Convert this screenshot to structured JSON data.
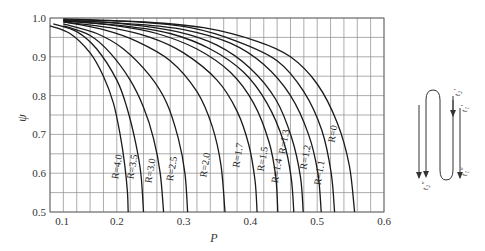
{
  "chart_data": {
    "type": "line",
    "title": "",
    "xlabel": "P",
    "ylabel": "ψ",
    "xlim": [
      0.1,
      0.6
    ],
    "ylim": [
      0.5,
      1.0
    ],
    "grid": true,
    "x_ticks": [
      "0.1",
      "0.2",
      "0.3",
      "0.4",
      "0.5",
      "0.6"
    ],
    "y_ticks": [
      "0.5",
      "0.6",
      "0.7",
      "0.8",
      "0.9",
      "1.0"
    ],
    "x_grid_step": 0.02,
    "y_grid_step": 0.05,
    "series": [
      {
        "name": "R=4.0",
        "points": [
          [
            0.1,
            0.98
          ],
          [
            0.13,
            0.96
          ],
          [
            0.16,
            0.91
          ],
          [
            0.18,
            0.85
          ],
          [
            0.195,
            0.78
          ],
          [
            0.205,
            0.7
          ],
          [
            0.212,
            0.62
          ],
          [
            0.216,
            0.55
          ],
          [
            0.217,
            0.5
          ]
        ]
      },
      {
        "name": "R=3.5",
        "points": [
          [
            0.105,
            0.985
          ],
          [
            0.14,
            0.965
          ],
          [
            0.17,
            0.92
          ],
          [
            0.2,
            0.84
          ],
          [
            0.215,
            0.77
          ],
          [
            0.228,
            0.68
          ],
          [
            0.236,
            0.6
          ],
          [
            0.24,
            0.5
          ]
        ]
      },
      {
        "name": "R=3.0",
        "points": [
          [
            0.12,
            0.98
          ],
          [
            0.16,
            0.955
          ],
          [
            0.19,
            0.91
          ],
          [
            0.22,
            0.84
          ],
          [
            0.24,
            0.77
          ],
          [
            0.255,
            0.69
          ],
          [
            0.265,
            0.6
          ],
          [
            0.27,
            0.5
          ]
        ]
      },
      {
        "name": "R=2.5",
        "points": [
          [
            0.12,
            0.985
          ],
          [
            0.17,
            0.96
          ],
          [
            0.21,
            0.92
          ],
          [
            0.25,
            0.85
          ],
          [
            0.275,
            0.78
          ],
          [
            0.292,
            0.69
          ],
          [
            0.302,
            0.6
          ],
          [
            0.306,
            0.5
          ]
        ]
      },
      {
        "name": "R=2.0",
        "points": [
          [
            0.12,
            0.99
          ],
          [
            0.18,
            0.97
          ],
          [
            0.23,
            0.94
          ],
          [
            0.28,
            0.89
          ],
          [
            0.32,
            0.81
          ],
          [
            0.343,
            0.72
          ],
          [
            0.356,
            0.62
          ],
          [
            0.362,
            0.5
          ]
        ]
      },
      {
        "name": "R=1.7",
        "points": [
          [
            0.12,
            0.99
          ],
          [
            0.19,
            0.975
          ],
          [
            0.25,
            0.95
          ],
          [
            0.3,
            0.91
          ],
          [
            0.35,
            0.84
          ],
          [
            0.38,
            0.76
          ],
          [
            0.398,
            0.67
          ],
          [
            0.407,
            0.58
          ],
          [
            0.41,
            0.5
          ]
        ]
      },
      {
        "name": "R=1.5",
        "points": [
          [
            0.12,
            0.992
          ],
          [
            0.2,
            0.98
          ],
          [
            0.26,
            0.96
          ],
          [
            0.32,
            0.92
          ],
          [
            0.37,
            0.86
          ],
          [
            0.405,
            0.78
          ],
          [
            0.428,
            0.68
          ],
          [
            0.438,
            0.59
          ],
          [
            0.441,
            0.5
          ]
        ]
      },
      {
        "name": "R=1.4",
        "points": [
          [
            0.12,
            0.993
          ],
          [
            0.21,
            0.98
          ],
          [
            0.28,
            0.96
          ],
          [
            0.34,
            0.92
          ],
          [
            0.39,
            0.86
          ],
          [
            0.425,
            0.78
          ],
          [
            0.45,
            0.68
          ],
          [
            0.461,
            0.59
          ],
          [
            0.465,
            0.5
          ]
        ]
      },
      {
        "name": "R=1.3",
        "points": [
          [
            0.12,
            0.994
          ],
          [
            0.21,
            0.985
          ],
          [
            0.29,
            0.965
          ],
          [
            0.35,
            0.93
          ],
          [
            0.4,
            0.87
          ],
          [
            0.438,
            0.79
          ],
          [
            0.462,
            0.69
          ],
          [
            0.475,
            0.59
          ],
          [
            0.479,
            0.5
          ]
        ]
      },
      {
        "name": "R=1.2",
        "points": [
          [
            0.12,
            0.995
          ],
          [
            0.22,
            0.985
          ],
          [
            0.3,
            0.97
          ],
          [
            0.37,
            0.935
          ],
          [
            0.42,
            0.88
          ],
          [
            0.46,
            0.8
          ],
          [
            0.487,
            0.7
          ],
          [
            0.501,
            0.6
          ],
          [
            0.506,
            0.5
          ]
        ]
      },
      {
        "name": "R=1.1",
        "points": [
          [
            0.12,
            0.996
          ],
          [
            0.23,
            0.99
          ],
          [
            0.31,
            0.975
          ],
          [
            0.38,
            0.94
          ],
          [
            0.44,
            0.89
          ],
          [
            0.48,
            0.81
          ],
          [
            0.507,
            0.71
          ],
          [
            0.521,
            0.6
          ],
          [
            0.526,
            0.5
          ]
        ]
      },
      {
        "name": "R=1.0",
        "points": [
          [
            0.12,
            0.998
          ],
          [
            0.24,
            0.99
          ],
          [
            0.33,
            0.975
          ],
          [
            0.41,
            0.94
          ],
          [
            0.46,
            0.9
          ],
          [
            0.5,
            0.83
          ],
          [
            0.53,
            0.73
          ],
          [
            0.548,
            0.62
          ],
          [
            0.556,
            0.5
          ]
        ]
      }
    ],
    "curve_labels": [
      {
        "text": "R=4.0",
        "P": 0.205,
        "psi": 0.615
      },
      {
        "text": "R=3.5",
        "P": 0.228,
        "psi": 0.615
      },
      {
        "text": "R=3.0",
        "P": 0.255,
        "psi": 0.605
      },
      {
        "text": "R=2.5",
        "P": 0.287,
        "psi": 0.61
      },
      {
        "text": "R=2.0",
        "P": 0.337,
        "psi": 0.62
      },
      {
        "text": "R=1.7",
        "P": 0.386,
        "psi": 0.645
      },
      {
        "text": "R=1.5",
        "P": 0.423,
        "psi": 0.635
      },
      {
        "text": "R=1.4",
        "P": 0.444,
        "psi": 0.605
      },
      {
        "text": "R=1.3",
        "P": 0.455,
        "psi": 0.68
      },
      {
        "text": "R=1.2",
        "P": 0.487,
        "psi": 0.64
      },
      {
        "text": "R=1.1",
        "P": 0.508,
        "psi": 0.6
      },
      {
        "text": "R=0",
        "P": 0.528,
        "psi": 0.7
      }
    ]
  },
  "diagram": {
    "labels": {
      "t2_in": "t₂′",
      "t1_in": "t₁′",
      "t1_out": "t₁″",
      "t2_out": "t₂″"
    }
  }
}
